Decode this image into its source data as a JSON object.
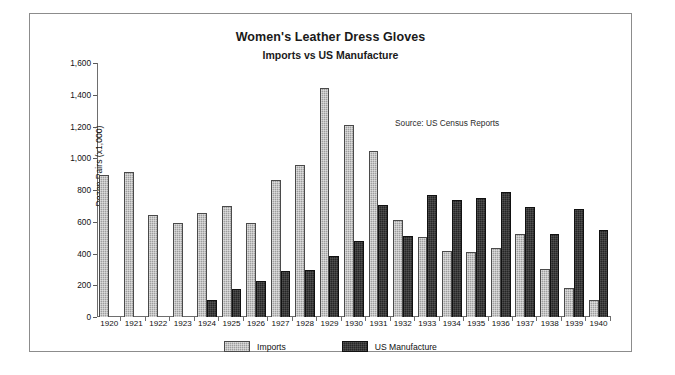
{
  "chart_data": {
    "type": "bar",
    "title": "Women's Leather Dress Gloves",
    "subtitle": "Imports vs US Manufacture",
    "annotation": "Source: US Census Reports",
    "xlabel": "",
    "ylabel": "Dozen Pairs (x1,000)",
    "ylim": [
      0,
      1600
    ],
    "ytick_step": 200,
    "ytick_labels": [
      "1,600",
      "1,400",
      "1,200",
      "1,000",
      "800",
      "600",
      "400",
      "200",
      "0"
    ],
    "ytick_values": [
      1600,
      1400,
      1200,
      1000,
      800,
      600,
      400,
      200,
      0
    ],
    "grid": false,
    "legend_position": "bottom-center",
    "categories": [
      "1920",
      "1921",
      "1922",
      "1923",
      "1924",
      "1925",
      "1926",
      "1927",
      "1928",
      "1929",
      "1930",
      "1931",
      "1932",
      "1933",
      "1934",
      "1935",
      "1936",
      "1937",
      "1938",
      "1939",
      "1940"
    ],
    "series": [
      {
        "name": "Imports",
        "color": "#9e9e9e",
        "values": [
          895,
          915,
          645,
          590,
          655,
          700,
          590,
          865,
          960,
          1445,
          1210,
          1045,
          610,
          505,
          415,
          410,
          435,
          525,
          300,
          185,
          110
        ]
      },
      {
        "name": "US Manufacture",
        "color": "#262626",
        "values": [
          0,
          0,
          0,
          0,
          110,
          175,
          230,
          290,
          295,
          385,
          480,
          705,
          510,
          770,
          735,
          750,
          785,
          690,
          520,
          680,
          545
        ]
      }
    ]
  },
  "legend": {
    "items": [
      {
        "label": "Imports"
      },
      {
        "label": "US Manufacture"
      }
    ]
  }
}
